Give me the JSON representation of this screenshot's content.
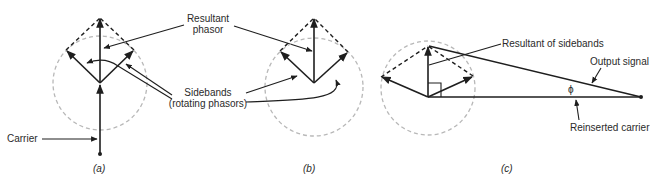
{
  "figure": {
    "panels": [
      {
        "id": "a",
        "label": "(a)",
        "annotations": {
          "carrier": "Carrier"
        }
      },
      {
        "id": "b",
        "label": "(b)"
      },
      {
        "id": "c",
        "label": "(c)",
        "annotations": {
          "resultant_of_sidebands": "Resultant of sidebands",
          "output_signal": "Output signal",
          "reinserted_carrier": "Reinserted carrier",
          "phase_angle": "ϕ"
        }
      }
    ],
    "shared_annotations": {
      "resultant_line1": "Resultant",
      "resultant_line2": "phasor",
      "sidebands_line1": "Sidebands",
      "sidebands_line2": "(rotating phasors)"
    },
    "colors": {
      "ink": "#1e1e1e",
      "circle": "#b8b8b8",
      "background": "#ffffff"
    }
  }
}
